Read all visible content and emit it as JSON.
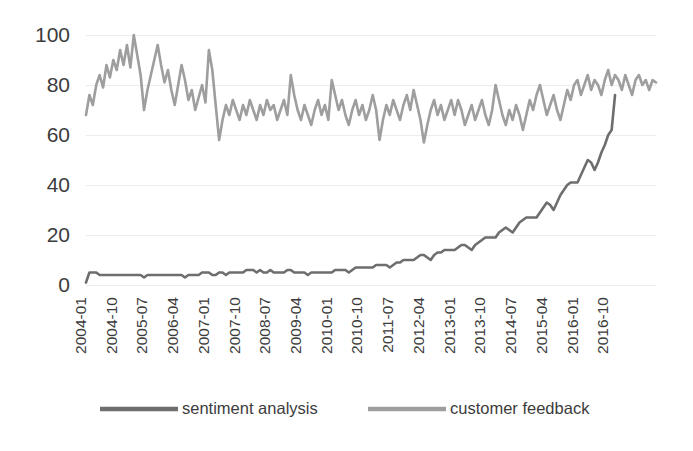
{
  "chart_data": {
    "type": "line",
    "title": "",
    "xlabel": "",
    "ylabel": "",
    "ylim": [
      0,
      100
    ],
    "yticks": [
      0,
      20,
      40,
      60,
      80,
      100
    ],
    "grid": true,
    "legend_position": "bottom",
    "x_tick_labels": [
      "2004-01",
      "2004-10",
      "2005-07",
      "2006-04",
      "2007-01",
      "2007-10",
      "2008-07",
      "2009-04",
      "2010-01",
      "2010-10",
      "2011-07",
      "2012-04",
      "2013-01",
      "2013-10",
      "2014-07",
      "2015-04",
      "2016-01",
      "2016-10"
    ],
    "x_tick_interval_months": 9,
    "x_start": "2004-01",
    "x_end": "2016-12",
    "series": [
      {
        "name": "sentiment analysis",
        "color": "#6e6e6e",
        "values": [
          1,
          5,
          5,
          5,
          4,
          4,
          4,
          4,
          4,
          4,
          4,
          4,
          4,
          4,
          4,
          4,
          4,
          3,
          4,
          4,
          4,
          4,
          4,
          4,
          4,
          4,
          4,
          4,
          4,
          3,
          4,
          4,
          4,
          4,
          5,
          5,
          5,
          4,
          4,
          5,
          5,
          4,
          5,
          5,
          5,
          5,
          5,
          6,
          6,
          6,
          5,
          6,
          5,
          5,
          6,
          5,
          5,
          5,
          5,
          6,
          6,
          5,
          5,
          5,
          5,
          4,
          5,
          5,
          5,
          5,
          5,
          5,
          5,
          6,
          6,
          6,
          6,
          5,
          6,
          7,
          7,
          7,
          7,
          7,
          7,
          8,
          8,
          8,
          8,
          7,
          8,
          9,
          9,
          10,
          10,
          10,
          10,
          11,
          12,
          12,
          11,
          10,
          12,
          13,
          13,
          14,
          14,
          14,
          14,
          15,
          16,
          16,
          15,
          14,
          16,
          17,
          18,
          19,
          19,
          19,
          19,
          21,
          22,
          23,
          22,
          21,
          23,
          25,
          26,
          27,
          27,
          27,
          27,
          29,
          31,
          33,
          32,
          30,
          33,
          36,
          38,
          40,
          41,
          41,
          41,
          44,
          47,
          50,
          49,
          46,
          49,
          53,
          56,
          60,
          62,
          76
        ]
      },
      {
        "name": "customer feedback",
        "color": "#9e9e9e",
        "values": [
          68,
          76,
          72,
          80,
          84,
          79,
          88,
          83,
          90,
          86,
          94,
          88,
          96,
          87,
          100,
          92,
          84,
          70,
          78,
          84,
          90,
          96,
          88,
          81,
          86,
          78,
          72,
          80,
          88,
          82,
          74,
          78,
          70,
          75,
          80,
          73,
          94,
          86,
          72,
          58,
          66,
          72,
          68,
          74,
          70,
          66,
          72,
          68,
          74,
          70,
          66,
          72,
          68,
          74,
          70,
          72,
          66,
          70,
          74,
          68,
          84,
          76,
          70,
          66,
          72,
          68,
          64,
          70,
          74,
          68,
          72,
          66,
          82,
          76,
          70,
          74,
          68,
          64,
          70,
          74,
          68,
          72,
          66,
          70,
          76,
          70,
          58,
          66,
          72,
          68,
          74,
          70,
          66,
          72,
          76,
          70,
          78,
          72,
          66,
          57,
          64,
          70,
          74,
          68,
          72,
          66,
          70,
          74,
          68,
          74,
          70,
          64,
          68,
          72,
          66,
          70,
          74,
          68,
          64,
          70,
          80,
          74,
          68,
          64,
          70,
          66,
          72,
          68,
          62,
          68,
          74,
          70,
          76,
          80,
          74,
          68,
          72,
          76,
          70,
          66,
          72,
          78,
          74,
          80,
          82,
          76,
          80,
          84,
          78,
          82,
          80,
          76,
          82,
          86,
          80,
          84,
          82,
          78,
          84,
          80,
          76,
          82,
          84,
          80,
          82,
          78,
          82,
          81
        ]
      }
    ]
  },
  "legend": {
    "items": [
      {
        "label": "sentiment analysis",
        "color": "#6e6e6e"
      },
      {
        "label": "customer feedback",
        "color": "#9e9e9e"
      }
    ]
  }
}
